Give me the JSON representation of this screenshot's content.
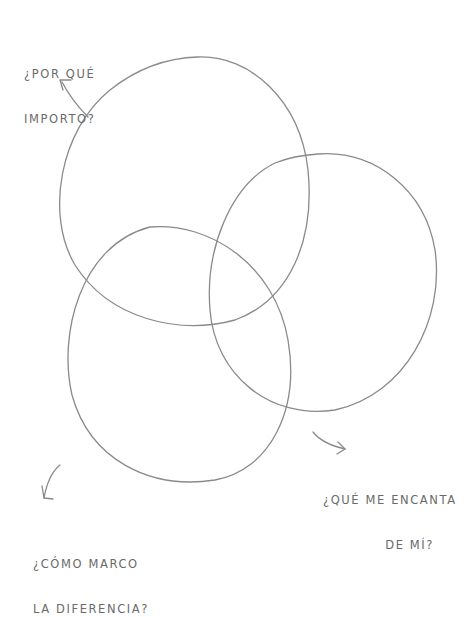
{
  "diagram": {
    "type": "venn",
    "stroke_color": "#8a8a8a",
    "text_color": "#6a6a6a",
    "circles": [
      {
        "id": "top-left",
        "label": "¿Por qué importo?"
      },
      {
        "id": "right",
        "label": "¿Qué me encanta de mí?"
      },
      {
        "id": "bottom-left",
        "label": "¿Cómo marco la diferencia?"
      }
    ]
  },
  "labels": {
    "top": {
      "line1": "¿POR QUÉ",
      "line2": "IMPORTO?"
    },
    "right": {
      "line1": "¿QUÉ ME ENCANTA",
      "line2": "DE MÍ?"
    },
    "bottom": {
      "line1": "¿CÓMO MARCO",
      "line2": "LA DIFERENCIA?"
    }
  }
}
